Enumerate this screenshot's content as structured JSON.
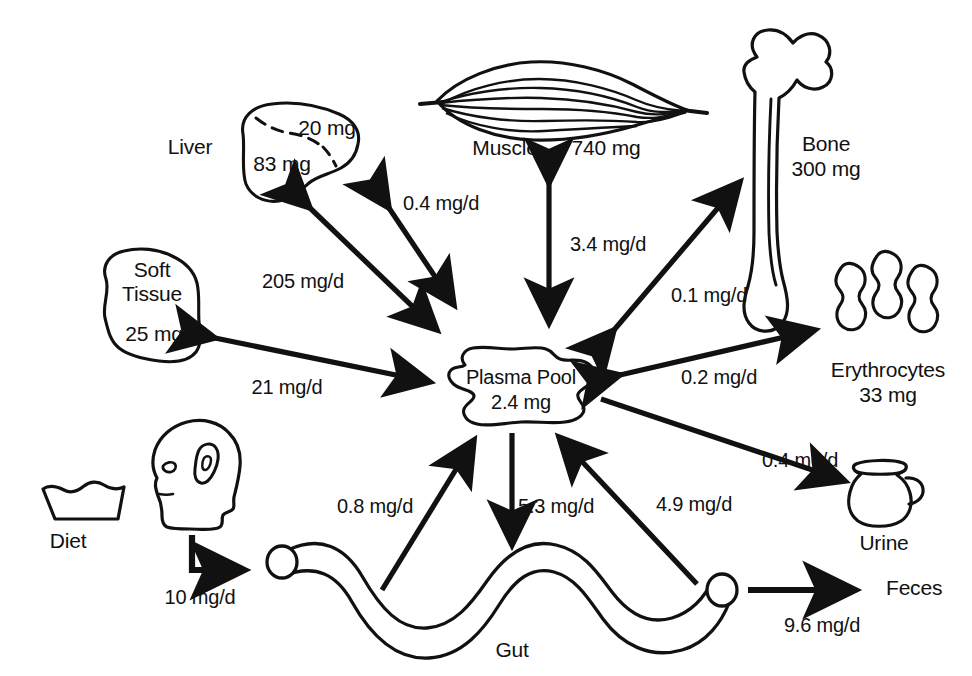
{
  "diagram": {
    "units": {
      "pool": "mg",
      "flux": "mg/d"
    },
    "stroke_color": "#111111",
    "background_color": "#ffffff"
  },
  "central_pool": {
    "name": "Plasma Pool",
    "mass": "2.4 mg",
    "icon": "blob-shape"
  },
  "compartments": [
    {
      "id": "liver",
      "label": "Liver",
      "mass": "83 mg",
      "mass_secondary": "20 mg",
      "icon": "liver-icon"
    },
    {
      "id": "muscle",
      "label": "Muscle",
      "mass": "740 mg",
      "icon": "muscle-icon"
    },
    {
      "id": "bone",
      "label": "Bone",
      "mass": "300 mg",
      "icon": "bone-icon"
    },
    {
      "id": "soft_tissue",
      "label": "Soft\nTissue",
      "mass": "25 mg",
      "icon": "soft-tissue-icon"
    },
    {
      "id": "erythrocytes",
      "label": "Erythrocytes",
      "mass": "33 mg",
      "icon": "erythrocytes-icon"
    },
    {
      "id": "gut",
      "label": "Gut",
      "mass": "",
      "icon": "gut-icon"
    },
    {
      "id": "diet",
      "label": "Diet",
      "mass": "",
      "icon": "diet-bowl-icon"
    },
    {
      "id": "head",
      "label": "",
      "mass": "",
      "icon": "head-profile-icon"
    },
    {
      "id": "urine",
      "label": "Urine",
      "mass": "",
      "icon": "urine-jug-icon"
    },
    {
      "id": "feces",
      "label": "Feces",
      "mass": "",
      "icon": "feces-label"
    }
  ],
  "fluxes": [
    {
      "id": "liver_plasma_small",
      "value": "0.4 mg/d",
      "from": "liver",
      "to": "plasma",
      "direction": "bidirectional"
    },
    {
      "id": "liver_plasma_large",
      "value": "205 mg/d",
      "from": "liver",
      "to": "plasma",
      "direction": "bidirectional"
    },
    {
      "id": "muscle_plasma",
      "value": "3.4 mg/d",
      "from": "muscle",
      "to": "plasma",
      "direction": "bidirectional"
    },
    {
      "id": "bone_plasma",
      "value": "0.1 mg/d",
      "from": "bone",
      "to": "plasma",
      "direction": "bidirectional"
    },
    {
      "id": "soft_tissue_plasma",
      "value": "21 mg/d",
      "from": "soft_tissue",
      "to": "plasma",
      "direction": "bidirectional"
    },
    {
      "id": "erythrocytes_plasma",
      "value": "0.2 mg/d",
      "from": "erythrocytes",
      "to": "plasma",
      "direction": "bidirectional"
    },
    {
      "id": "plasma_urine",
      "value": "0.4 mg/d",
      "from": "plasma",
      "to": "urine",
      "direction": "unidirectional"
    },
    {
      "id": "diet_gut",
      "value": "10 mg/d",
      "from": "diet",
      "to": "gut",
      "direction": "unidirectional"
    },
    {
      "id": "gut_plasma_absorb_a",
      "value": "0.8 mg/d",
      "from": "gut",
      "to": "plasma",
      "direction": "unidirectional"
    },
    {
      "id": "plasma_gut_secrete",
      "value": "5.3 mg/d",
      "from": "plasma",
      "to": "gut",
      "direction": "unidirectional"
    },
    {
      "id": "gut_plasma_absorb_b",
      "value": "4.9 mg/d",
      "from": "gut",
      "to": "plasma",
      "direction": "unidirectional"
    },
    {
      "id": "gut_feces",
      "value": "9.6 mg/d",
      "from": "gut",
      "to": "feces",
      "direction": "unidirectional"
    }
  ]
}
